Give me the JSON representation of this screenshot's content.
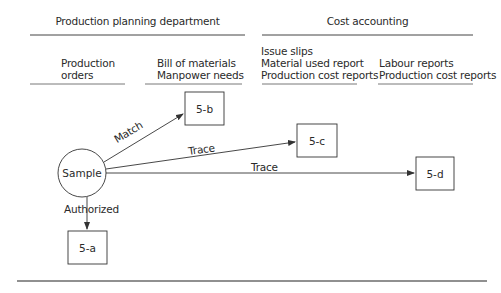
{
  "header": {
    "left_title": "Production planning department",
    "right_title": "Cost accounting"
  },
  "columns": [
    {
      "lines": [
        "Production",
        "orders"
      ]
    },
    {
      "lines": [
        "Bill of materials",
        "Manpower needs"
      ]
    },
    {
      "lines": [
        "Issue slips",
        "Material used report",
        "Production cost reports"
      ]
    },
    {
      "lines": [
        "Labour reports",
        "Production cost reports"
      ]
    }
  ],
  "nodes": {
    "sample": "Sample",
    "box_a": "5-a",
    "box_b": "5-b",
    "box_c": "5-c",
    "box_d": "5-d"
  },
  "edges": {
    "match": "Match",
    "trace_c": "Trace",
    "trace_d": "Trace",
    "authorized": "Authorized"
  },
  "colors": {
    "line": "#333333",
    "text": "#2a2a2a"
  }
}
